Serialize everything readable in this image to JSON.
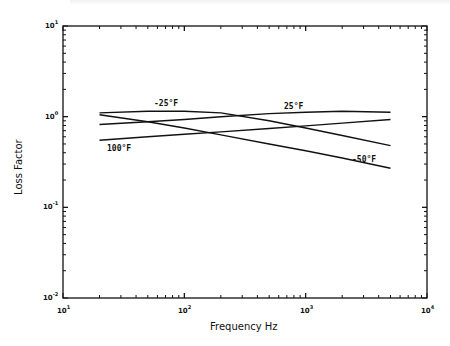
{
  "chart_data": {
    "type": "line",
    "title": "",
    "xlabel": "Frequency Hz",
    "ylabel": "Loss Factor",
    "xscale": "log",
    "yscale": "log",
    "xlim": [
      10,
      10000
    ],
    "ylim": [
      0.01,
      10
    ],
    "x_tick_labels": [
      "10^1",
      "10^2",
      "10^3",
      "10^4"
    ],
    "y_tick_labels": [
      "10^-2",
      "10^-1",
      "10^0",
      "10^1"
    ],
    "grid": false,
    "legend": "inline labels",
    "series": [
      {
        "name": "-25°F",
        "x": [
          20,
          50,
          100,
          200,
          500,
          1000,
          2000,
          5000
        ],
        "y": [
          1.1,
          1.15,
          1.15,
          1.1,
          0.9,
          0.75,
          0.62,
          0.48
        ]
      },
      {
        "name": "25°F",
        "x": [
          20,
          50,
          100,
          200,
          500,
          1000,
          2000,
          5000
        ],
        "y": [
          0.82,
          0.88,
          0.93,
          1.0,
          1.08,
          1.12,
          1.15,
          1.12
        ]
      },
      {
        "name": "100°F",
        "x": [
          20,
          50,
          100,
          200,
          500,
          1000,
          2000,
          5000
        ],
        "y": [
          0.55,
          0.6,
          0.64,
          0.68,
          0.74,
          0.79,
          0.85,
          0.93
        ]
      },
      {
        "name": "-50°F",
        "x": [
          20,
          50,
          100,
          200,
          500,
          1000,
          2000,
          5000
        ],
        "y": [
          1.05,
          0.88,
          0.75,
          0.63,
          0.5,
          0.42,
          0.35,
          0.27
        ]
      }
    ]
  },
  "labels": {
    "xlabel": "Frequency Hz",
    "ylabel": "Loss Factor",
    "xticks": [
      "10",
      "10",
      "10",
      "10"
    ],
    "xticks_exp": [
      "1",
      "2",
      "3",
      "4"
    ],
    "yticks": [
      "10",
      "10",
      "10",
      "10"
    ],
    "yticks_exp": [
      "1",
      "0",
      "-1",
      "-2"
    ],
    "curve_labels": [
      "-25°F",
      "25°F",
      "100°F",
      "-50°F"
    ]
  }
}
